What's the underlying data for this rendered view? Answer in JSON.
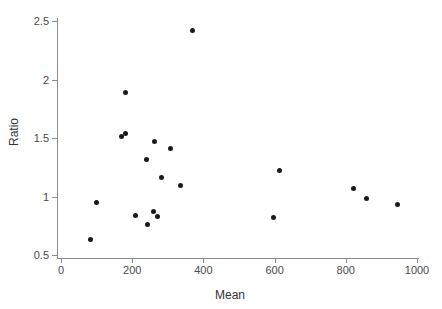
{
  "chart_data": {
    "type": "scatter",
    "title": "",
    "xlabel": "Mean",
    "ylabel": "Ratio",
    "xlim": [
      0,
      1000
    ],
    "ylim": [
      0.5,
      2.5
    ],
    "xticks": [
      0,
      200,
      400,
      600,
      800,
      1000
    ],
    "xtick_labels": [
      "0",
      "200",
      "400",
      "600",
      "800",
      "1000"
    ],
    "yticks": [
      0.5,
      1,
      1.5,
      2,
      2.5
    ],
    "ytick_labels": [
      "0.5",
      "1",
      "1.5",
      "2",
      "2.5"
    ],
    "grid": false,
    "legend": null,
    "marker": "filled-circle",
    "marker_color": "#1a1a1a",
    "points": [
      {
        "x": 82,
        "y": 0.63
      },
      {
        "x": 101,
        "y": 0.95
      },
      {
        "x": 169,
        "y": 1.51
      },
      {
        "x": 180,
        "y": 1.89
      },
      {
        "x": 180,
        "y": 1.54
      },
      {
        "x": 209,
        "y": 0.84
      },
      {
        "x": 239,
        "y": 1.32
      },
      {
        "x": 242,
        "y": 0.76
      },
      {
        "x": 259,
        "y": 0.87
      },
      {
        "x": 262,
        "y": 1.47
      },
      {
        "x": 272,
        "y": 0.83
      },
      {
        "x": 283,
        "y": 1.16
      },
      {
        "x": 307,
        "y": 1.41
      },
      {
        "x": 335,
        "y": 1.09
      },
      {
        "x": 369,
        "y": 2.42
      },
      {
        "x": 597,
        "y": 0.82
      },
      {
        "x": 614,
        "y": 1.22
      },
      {
        "x": 822,
        "y": 1.07
      },
      {
        "x": 859,
        "y": 0.98
      },
      {
        "x": 946,
        "y": 0.93
      }
    ]
  },
  "axes": {
    "y_title": "Ratio",
    "x_title": "Mean"
  },
  "colors": {
    "marker": "#1a1a1a",
    "axis": "#8c8c8c",
    "tick_text": "#4a4a4a",
    "title_text": "#333333",
    "background": "#ffffff"
  }
}
